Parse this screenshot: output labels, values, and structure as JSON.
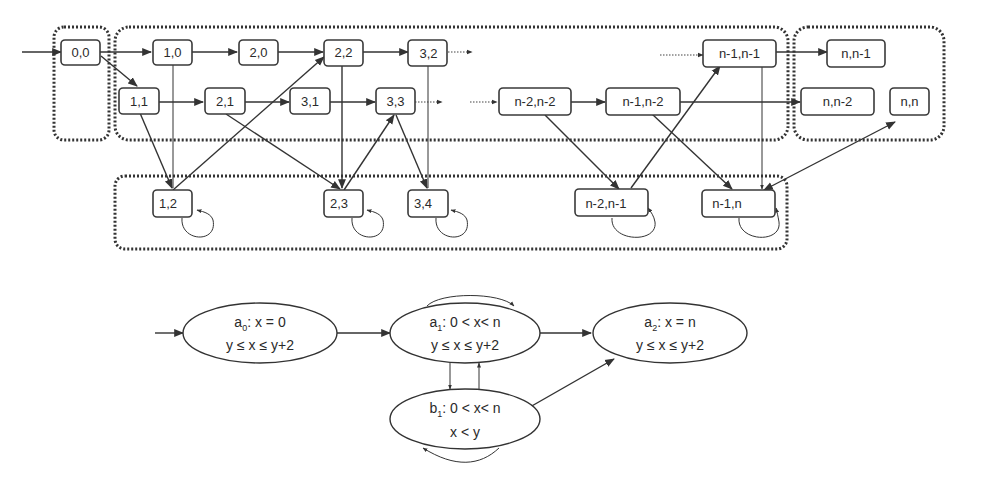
{
  "upper_graph": {
    "groups": [
      {
        "id": "g00",
        "label": "group-0-0"
      },
      {
        "id": "gmain",
        "label": "group-main"
      },
      {
        "id": "gn",
        "label": "group-n"
      },
      {
        "id": "gbottom",
        "label": "group-bottom"
      }
    ],
    "nodes": {
      "n00": "0,0",
      "n10": "1,0",
      "n20": "2,0",
      "n22": "2,2",
      "n32": "3,2",
      "n11": "1,1",
      "n21": "2,1",
      "n31": "3,1",
      "n33": "3,3",
      "nm2m2": "n-2,n-2",
      "nm1m2": "n-1,n-2",
      "nm1m1": "n-1,n-1",
      "nnm1": "n,n-1",
      "nnm2": "n,n-2",
      "nnn": "n,n",
      "n12": "1,2",
      "n23": "2,3",
      "n34": "3,4",
      "nm2m1": "n-2,n-1",
      "nm1n": "n-1,n"
    }
  },
  "lower_graph": {
    "states": {
      "a0": {
        "name": "a",
        "sub": "0",
        "cond1": ": x = 0",
        "cond2": "y ≤ x ≤ y+2"
      },
      "a1": {
        "name": "a",
        "sub": "1",
        "cond1": ": 0 < x< n",
        "cond2": "y ≤ x ≤ y+2"
      },
      "a2": {
        "name": "a",
        "sub": "2",
        "cond1": ": x = n",
        "cond2": "y ≤ x ≤ y+2"
      },
      "b1": {
        "name": "b",
        "sub": "1",
        "cond1": ": 0 < x< n",
        "cond2": "x < y"
      }
    }
  }
}
